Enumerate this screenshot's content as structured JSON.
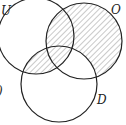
{
  "diagram": {
    "type": "venn",
    "sets": [
      {
        "name": "U",
        "label": "U"
      },
      {
        "name": "O",
        "label": "O"
      },
      {
        "name": "D",
        "label": "D"
      }
    ],
    "shaded_regions": [
      "O only",
      "U∩O not D",
      "U∩D not O",
      "U∩O∩D"
    ],
    "edge_fragment": ")",
    "colors": {
      "stroke": "#222222",
      "hatch": "#555555",
      "background": "#ffffff"
    }
  }
}
